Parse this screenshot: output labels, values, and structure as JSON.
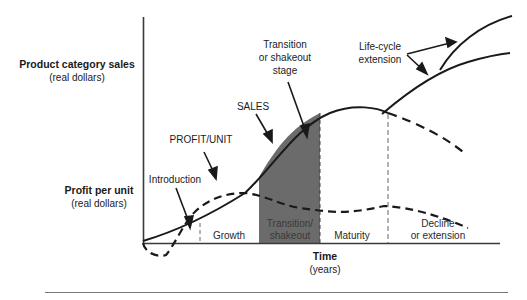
{
  "diagram": {
    "colors": {
      "line": "#1a1a1a",
      "shade": "#6b6b6b",
      "background": "#ffffff"
    },
    "y_axis_labels": {
      "sales": {
        "title": "Product category sales",
        "subtitle": "(real dollars)"
      },
      "profit": {
        "title": "Profit per unit",
        "subtitle": "(real dollars)"
      }
    },
    "x_axis_label": {
      "title": "Time",
      "subtitle": "(years)"
    },
    "curves": {
      "sales": {
        "label": "SALES",
        "style": "solid"
      },
      "profit": {
        "label": "PROFIT/UNIT",
        "style": "dashed"
      }
    },
    "callouts": {
      "introduction": "Introduction",
      "transition_stage": [
        "Transition",
        "or shakeout",
        "stage"
      ],
      "life_cycle_extension": [
        "Life-cycle",
        "extension"
      ]
    },
    "stages": [
      {
        "name": "Introduction",
        "lines": []
      },
      {
        "name": "Growth",
        "lines": [
          "Growth"
        ]
      },
      {
        "name": "Transition/shakeout",
        "lines": [
          "Transition/",
          "shakeout"
        ],
        "shaded": true
      },
      {
        "name": "Maturity",
        "lines": [
          "Maturity"
        ]
      },
      {
        "name": "Decline or extension",
        "lines": [
          "Decline",
          "or extension"
        ]
      }
    ]
  }
}
